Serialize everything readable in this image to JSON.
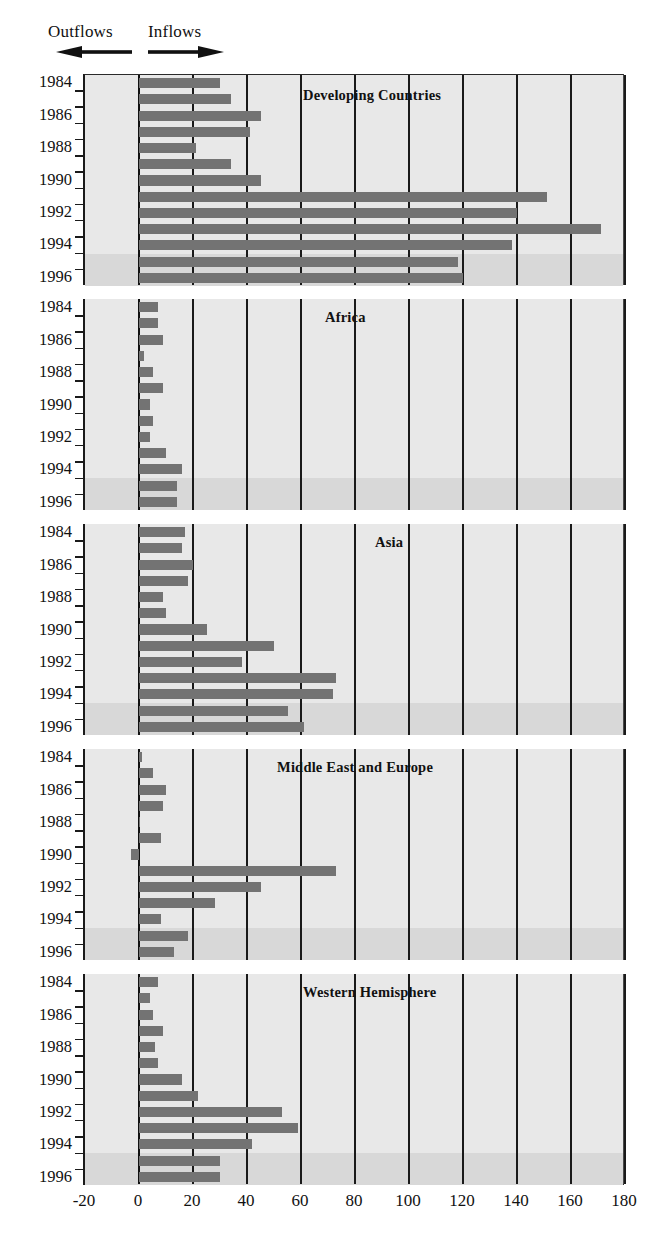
{
  "legend": {
    "outflows_label": "Outflows",
    "inflows_label": "Inflows",
    "left_arrow_icon": "arrow-left-icon",
    "right_arrow_icon": "arrow-right-icon"
  },
  "axis": {
    "x_ticks": [
      "-20",
      "0",
      "20",
      "40",
      "60",
      "80",
      "100",
      "120",
      "140",
      "160",
      "180"
    ],
    "x_tick_values": [
      -20,
      0,
      20,
      40,
      60,
      80,
      100,
      120,
      140,
      160,
      180
    ],
    "y_ticks": [
      "1984",
      "1986",
      "1988",
      "1990",
      "1992",
      "1994",
      "1996"
    ]
  },
  "chart_data": {
    "type": "bar",
    "orientation": "horizontal",
    "title": "",
    "xlabel": "",
    "ylabel": "",
    "xlim": [
      -20,
      180
    ],
    "grid": true,
    "legend_position": "top-left",
    "annotations": [
      "Outflows",
      "Inflows"
    ],
    "shaded_years": [
      1995,
      1996
    ],
    "categories": [
      1984,
      1985,
      1986,
      1987,
      1988,
      1989,
      1990,
      1991,
      1992,
      1993,
      1994,
      1995,
      1996
    ],
    "panels": [
      {
        "title": "Developing Countries",
        "values": [
          30,
          34,
          45,
          41,
          21,
          34,
          45,
          151,
          140,
          171,
          138,
          118,
          120
        ]
      },
      {
        "title": "Africa",
        "values": [
          7,
          7,
          9,
          2,
          5,
          9,
          4,
          5,
          4,
          10,
          16,
          14,
          14
        ]
      },
      {
        "title": "Asia",
        "values": [
          17,
          16,
          20,
          18,
          9,
          10,
          25,
          50,
          38,
          73,
          72,
          55,
          61
        ]
      },
      {
        "title": "Middle East and Europe",
        "values": [
          1,
          5,
          10,
          9,
          0,
          8,
          -3,
          73,
          45,
          28,
          8,
          18,
          13
        ]
      },
      {
        "title": "Western Hemisphere",
        "values": [
          7,
          4,
          5,
          9,
          6,
          7,
          16,
          22,
          53,
          59,
          42,
          30,
          30
        ]
      }
    ]
  }
}
